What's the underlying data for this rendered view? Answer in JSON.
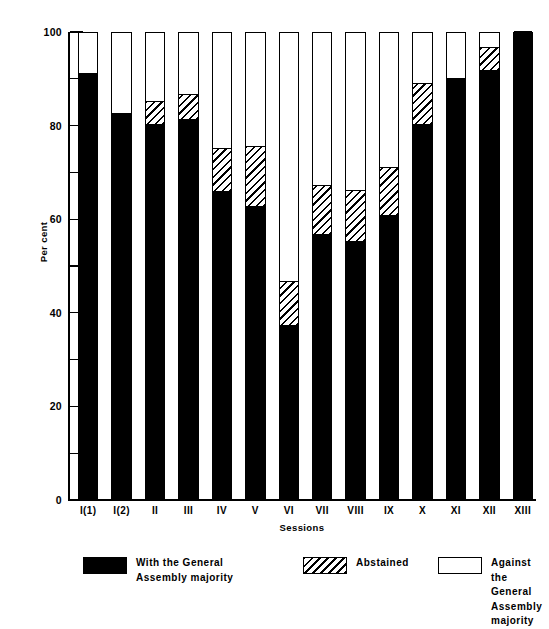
{
  "chart_data": {
    "type": "bar",
    "subtype": "stacked-vertical-100pct",
    "title": "",
    "subtitle": "",
    "xlabel": "Sessions",
    "ylabel": "Per cent",
    "ylim": [
      0,
      100
    ],
    "yticks": [
      0,
      10,
      20,
      30,
      40,
      50,
      60,
      70,
      80,
      90,
      100
    ],
    "ytick_labels_shown": [
      "0",
      "20",
      "40",
      "60",
      "80",
      "100"
    ],
    "ytick_major_interval": 20,
    "ytick_minor_interval": 10,
    "grid": false,
    "legend_position": "bottom",
    "categories": [
      "I(1)",
      "I(2)",
      "II",
      "III",
      "IV",
      "V",
      "VI",
      "VII",
      "VIII",
      "IX",
      "X",
      "XI",
      "XII",
      "XIII"
    ],
    "series": [
      {
        "name": "With the General\nAssembly majority",
        "key": "with",
        "color": "#000000",
        "pattern": "solid",
        "values": [
          91,
          82.5,
          80,
          81,
          65.5,
          62.5,
          37,
          56.5,
          55,
          60.5,
          80,
          90,
          91.5,
          100
        ]
      },
      {
        "name": "Abstained",
        "key": "abstained",
        "color": "#000000",
        "pattern": "diagonal-hatch",
        "values": [
          0,
          0,
          5,
          5.5,
          9.5,
          13,
          9.5,
          10.5,
          11,
          10.5,
          9,
          0,
          5,
          0
        ]
      },
      {
        "name": "Against the General\nAssembly majority",
        "key": "against",
        "color": "#ffffff",
        "pattern": "empty",
        "values": [
          9,
          17.5,
          15,
          13.5,
          25,
          24.5,
          53.5,
          33,
          34,
          29,
          11,
          10,
          3.5,
          0
        ]
      }
    ]
  },
  "axes": {
    "y_title": "Per cent",
    "x_title": "Sessions",
    "y_tick_labels": [
      {
        "value": 100,
        "label": "100"
      },
      {
        "value": 90,
        "label": ""
      },
      {
        "value": 80,
        "label": "80"
      },
      {
        "value": 70,
        "label": ""
      },
      {
        "value": 60,
        "label": "60"
      },
      {
        "value": 50,
        "label": ""
      },
      {
        "value": 40,
        "label": "40"
      },
      {
        "value": 30,
        "label": ""
      },
      {
        "value": 20,
        "label": "20"
      },
      {
        "value": 10,
        "label": ""
      },
      {
        "value": 0,
        "label": "0"
      }
    ],
    "x_tick_labels": [
      "I(1)",
      "I(2)",
      "II",
      "III",
      "IV",
      "V",
      "VI",
      "VII",
      "VIII",
      "IX",
      "X",
      "XI",
      "XII",
      "XIII"
    ]
  },
  "legend": {
    "items": [
      {
        "id": "with",
        "label": "With the General\nAssembly majority",
        "swatch": "solid-black-swatch"
      },
      {
        "id": "abstained",
        "label": "Abstained",
        "swatch": "hatched-swatch"
      },
      {
        "id": "against",
        "label": "Against the General\nAssembly majority",
        "swatch": "empty-swatch"
      }
    ]
  },
  "colors": {
    "ink": "#000000",
    "paper": "#ffffff"
  }
}
